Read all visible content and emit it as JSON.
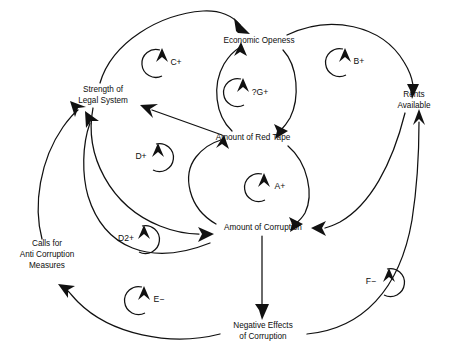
{
  "diagram": {
    "type": "causal-loop-diagram",
    "background_color": "#ffffff",
    "line_color": "#111111",
    "text_color": "#0d0d0d",
    "width": 456,
    "height": 353
  },
  "variables": [
    {
      "id": "economic-openess",
      "label_lines": [
        "Economic Openess"
      ],
      "label": "Economic Openess",
      "x": 259,
      "y": 41
    },
    {
      "id": "strength-of-legal-system",
      "label_lines": [
        "Strength of",
        "Legal System"
      ],
      "label": "Strength of Legal System",
      "x": 103,
      "y": 95
    },
    {
      "id": "rents-available",
      "label_lines": [
        "Rents",
        "Available"
      ],
      "label": "Rents Available",
      "x": 414,
      "y": 100
    },
    {
      "id": "amount-of-red-tape",
      "label_lines": [
        "Amount of Red Tape"
      ],
      "label": "Amount of Red Tape",
      "x": 253,
      "y": 138
    },
    {
      "id": "amount-of-corruption",
      "label_lines": [
        "Amount of Corruption"
      ],
      "label": "Amount of Corruption",
      "x": 263,
      "y": 228
    },
    {
      "id": "calls-for-anti-corruption-measures",
      "label_lines": [
        "Calls for",
        "Anti Corruption",
        "Measures"
      ],
      "label": "Calls for Anti Corruption Measures",
      "x": 47,
      "y": 255
    },
    {
      "id": "negative-effects-of-corruption",
      "label_lines": [
        "Negative Effects",
        "of Corruption"
      ],
      "label": "Negative Effects of Corruption",
      "x": 263,
      "y": 331
    }
  ],
  "loops": [
    {
      "id": "loop-c",
      "label": "C+",
      "x": 170,
      "y": 63,
      "polarity": "+",
      "rotation": "counterclockwise"
    },
    {
      "id": "loop-g",
      "label": "?G+",
      "x": 253,
      "y": 92,
      "polarity": "+",
      "rotation": "counterclockwise"
    },
    {
      "id": "loop-b",
      "label": "B+",
      "x": 353,
      "y": 62,
      "polarity": "+",
      "rotation": "counterclockwise"
    },
    {
      "id": "loop-d",
      "label": "D+",
      "x": 147,
      "y": 157,
      "polarity": "+",
      "rotation": "clockwise"
    },
    {
      "id": "loop-a",
      "label": "A+",
      "x": 274,
      "y": 187,
      "polarity": "+",
      "rotation": "counterclockwise"
    },
    {
      "id": "loop-d2",
      "label": "D2+",
      "x": 131,
      "y": 239,
      "polarity": "+",
      "rotation": "clockwise"
    },
    {
      "id": "loop-f",
      "label": "F−",
      "x": 378,
      "y": 282,
      "polarity": "−",
      "rotation": "clockwise"
    },
    {
      "id": "loop-e",
      "label": "E−",
      "x": 152,
      "y": 300,
      "polarity": "−",
      "rotation": "counterclockwise"
    }
  ],
  "links": [
    {
      "id": "link-legal-to-openess",
      "from": "strength-of-legal-system",
      "to": "economic-openess"
    },
    {
      "id": "link-openess-to-rents",
      "from": "economic-openess",
      "to": "rents-available"
    },
    {
      "id": "link-redtape-to-openess",
      "from": "amount-of-red-tape",
      "to": "economic-openess"
    },
    {
      "id": "link-openess-to-redtape",
      "from": "economic-openess",
      "to": "amount-of-red-tape"
    },
    {
      "id": "link-redtape-to-legal",
      "from": "amount-of-red-tape",
      "to": "strength-of-legal-system"
    },
    {
      "id": "link-redtape-to-corruption",
      "from": "amount-of-red-tape",
      "to": "amount-of-corruption"
    },
    {
      "id": "link-corruption-to-redtape",
      "from": "amount-of-corruption",
      "to": "amount-of-red-tape"
    },
    {
      "id": "link-legal-to-corruption",
      "from": "strength-of-legal-system",
      "to": "amount-of-corruption"
    },
    {
      "id": "link-rents-to-corruption",
      "from": "rents-available",
      "to": "amount-of-corruption"
    },
    {
      "id": "link-corruption-to-negative",
      "from": "amount-of-corruption",
      "to": "negative-effects-of-corruption"
    },
    {
      "id": "link-negative-to-calls",
      "from": "negative-effects-of-corruption",
      "to": "calls-for-anti-corruption-measures"
    },
    {
      "id": "link-negative-to-rents",
      "from": "negative-effects-of-corruption",
      "to": "rents-available"
    },
    {
      "id": "link-calls-to-legal",
      "from": "calls-for-anti-corruption-measures",
      "to": "strength-of-legal-system"
    },
    {
      "id": "link-corruption-to-legal",
      "from": "amount-of-corruption",
      "to": "strength-of-legal-system"
    }
  ]
}
